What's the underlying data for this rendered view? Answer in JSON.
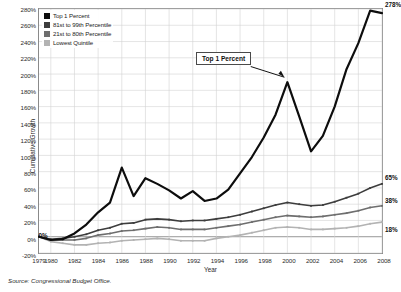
{
  "chart_data": {
    "type": "line",
    "title": "",
    "xlabel": "Year",
    "ylabel": "Cumulative Growth",
    "grid": true,
    "legend_position": "top-left",
    "xlim": [
      1979,
      2008
    ],
    "ylim": [
      -20,
      280
    ],
    "ytick_step": 20,
    "ytick_labels": [
      "280%",
      "260%",
      "240%",
      "220%",
      "200%",
      "180%",
      "160%",
      "140%",
      "120%",
      "100%",
      "80%",
      "60%",
      "40%",
      "20%",
      "0%",
      "-20%"
    ],
    "ytick_values": [
      280,
      260,
      240,
      220,
      200,
      180,
      160,
      140,
      120,
      100,
      80,
      60,
      40,
      20,
      0,
      -20
    ],
    "xtick_labels": [
      "1979",
      "1980",
      "1982",
      "1984",
      "1986",
      "1988",
      "1990",
      "1992",
      "1994",
      "1996",
      "1998",
      "2000",
      "2002",
      "2004",
      "2006",
      "2008"
    ],
    "xtick_values": [
      1979,
      1980,
      1982,
      1984,
      1986,
      1988,
      1990,
      1992,
      1994,
      1996,
      1998,
      2000,
      2002,
      2004,
      2006,
      2008
    ],
    "x": [
      1979,
      1980,
      1981,
      1982,
      1983,
      1984,
      1985,
      1986,
      1987,
      1988,
      1989,
      1990,
      1991,
      1992,
      1993,
      1994,
      1995,
      1996,
      1997,
      1998,
      1999,
      2000,
      2001,
      2002,
      2003,
      2004,
      2005,
      2006,
      2007,
      2008
    ],
    "series": [
      {
        "name": "Top 1 Percent",
        "color": "#0d0d0d",
        "end_label": "278%",
        "values": [
          0,
          -4,
          -3,
          4,
          15,
          30,
          42,
          85,
          50,
          72,
          65,
          57,
          47,
          56,
          44,
          47,
          58,
          78,
          98,
          122,
          150,
          190,
          148,
          105,
          124,
          160,
          206,
          238,
          278,
          275
        ]
      },
      {
        "name": "81st to 99th Percentile",
        "color": "#3d3d3d",
        "end_label": "65%",
        "values": [
          0,
          -3,
          -2,
          0,
          3,
          8,
          11,
          16,
          17,
          21,
          22,
          21,
          19,
          20,
          20,
          22,
          24,
          27,
          31,
          35,
          39,
          42,
          40,
          38,
          39,
          43,
          48,
          53,
          60,
          65
        ]
      },
      {
        "name": "21st to 80th Percentile",
        "color": "#6e6e6e",
        "end_label": "38%",
        "values": [
          0,
          -4,
          -4,
          -4,
          -2,
          2,
          4,
          7,
          8,
          10,
          12,
          11,
          9,
          9,
          9,
          11,
          13,
          15,
          18,
          21,
          24,
          26,
          25,
          24,
          25,
          27,
          29,
          32,
          36,
          38
        ]
      },
      {
        "name": "Lowest Quintile",
        "color": "#b3b3b3",
        "end_label": "18%",
        "values": [
          0,
          -6,
          -8,
          -10,
          -10,
          -8,
          -7,
          -5,
          -4,
          -3,
          -2,
          -3,
          -5,
          -5,
          -5,
          -2,
          0,
          2,
          5,
          8,
          11,
          12,
          11,
          9,
          9,
          10,
          11,
          13,
          16,
          18
        ]
      }
    ],
    "annotations": [
      {
        "text": "Top 1 Percent",
        "points_to_year": 2000,
        "points_to_value": 190
      }
    ],
    "origin_marker": {
      "text": "0%",
      "year": 1979,
      "value": 0
    }
  },
  "legend": {
    "items": [
      {
        "label": "Top 1 Percent",
        "color": "#0d0d0d"
      },
      {
        "label": "81st to 99th Percentile",
        "color": "#3d3d3d"
      },
      {
        "label": "21st to 80th Percentile",
        "color": "#6e6e6e"
      },
      {
        "label": "Lowest Quintile",
        "color": "#b3b3b3"
      }
    ]
  },
  "footer": {
    "source": "Source: Congressional Budget Office."
  }
}
